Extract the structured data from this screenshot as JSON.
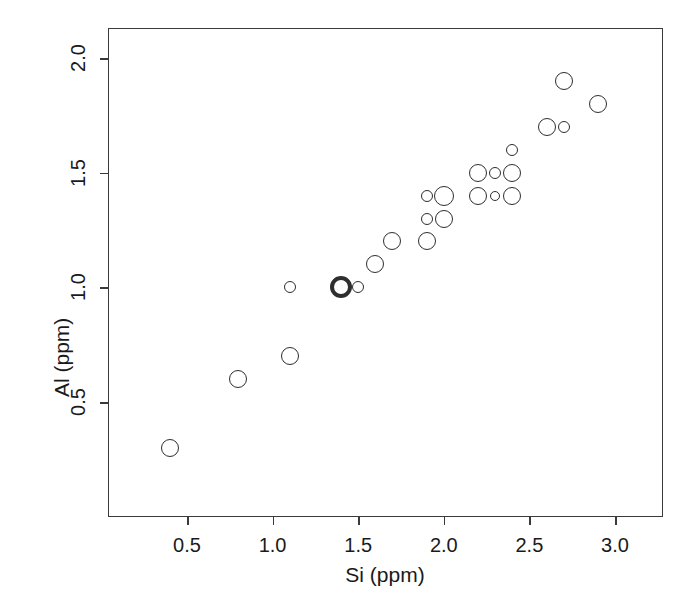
{
  "chart_data": {
    "type": "scatter",
    "title": "",
    "xlabel": "Si (ppm)",
    "ylabel": "Al (ppm)",
    "xlim": [
      0.24,
      3.22
    ],
    "ylim": [
      0.18,
      2.12
    ],
    "xticks": [
      "0.5",
      "1.0",
      "1.5",
      "2.0",
      "2.5",
      "3.0"
    ],
    "xtick_values": [
      0.5,
      1.0,
      1.5,
      2.0,
      2.5,
      3.0
    ],
    "yticks": [
      "0.5",
      "1.0",
      "1.5",
      "2.0"
    ],
    "ytick_values": [
      0.5,
      1.0,
      1.5,
      2.0
    ],
    "grid": false,
    "legend": "none",
    "marker": "open-circle",
    "marker_color": "#2e2e2e",
    "x": [
      0.4,
      0.8,
      1.1,
      1.1,
      1.4,
      1.5,
      1.6,
      1.7,
      1.9,
      1.9,
      1.9,
      2.0,
      2.0,
      2.2,
      2.2,
      2.3,
      2.3,
      2.4,
      2.4,
      2.4,
      2.6,
      2.7,
      2.7,
      2.9
    ],
    "y": [
      0.3,
      0.6,
      0.7,
      1.0,
      1.0,
      1.0,
      1.1,
      1.2,
      1.2,
      1.3,
      1.4,
      1.3,
      1.4,
      1.4,
      1.5,
      1.4,
      1.5,
      1.4,
      1.5,
      1.6,
      1.7,
      1.7,
      1.9,
      1.8
    ],
    "sizes": [
      9,
      9,
      9,
      6,
      11,
      6,
      9,
      9,
      9,
      6,
      6,
      9,
      10,
      9,
      9,
      5,
      6,
      9,
      9,
      6,
      9,
      6,
      9,
      9
    ],
    "emphasis_index": 4,
    "emphasis_note": "bold thick-stroke circle at (1.4, 1.0)",
    "points": [
      {
        "x": 0.4,
        "y": 0.3,
        "size": 9,
        "bold": false
      },
      {
        "x": 0.8,
        "y": 0.6,
        "size": 9,
        "bold": false
      },
      {
        "x": 1.1,
        "y": 0.7,
        "size": 9,
        "bold": false
      },
      {
        "x": 1.1,
        "y": 1.0,
        "size": 6,
        "bold": false
      },
      {
        "x": 1.4,
        "y": 1.0,
        "size": 11,
        "bold": true
      },
      {
        "x": 1.5,
        "y": 1.0,
        "size": 6,
        "bold": false
      },
      {
        "x": 1.6,
        "y": 1.1,
        "size": 9,
        "bold": false
      },
      {
        "x": 1.7,
        "y": 1.2,
        "size": 9,
        "bold": false
      },
      {
        "x": 1.9,
        "y": 1.2,
        "size": 9,
        "bold": false
      },
      {
        "x": 1.9,
        "y": 1.3,
        "size": 6,
        "bold": false
      },
      {
        "x": 1.9,
        "y": 1.4,
        "size": 6,
        "bold": false
      },
      {
        "x": 2.0,
        "y": 1.3,
        "size": 9,
        "bold": false
      },
      {
        "x": 2.0,
        "y": 1.4,
        "size": 10,
        "bold": false
      },
      {
        "x": 2.2,
        "y": 1.4,
        "size": 9,
        "bold": false
      },
      {
        "x": 2.2,
        "y": 1.5,
        "size": 9,
        "bold": false
      },
      {
        "x": 2.3,
        "y": 1.4,
        "size": 5,
        "bold": false
      },
      {
        "x": 2.3,
        "y": 1.5,
        "size": 6,
        "bold": false
      },
      {
        "x": 2.4,
        "y": 1.4,
        "size": 9,
        "bold": false
      },
      {
        "x": 2.4,
        "y": 1.5,
        "size": 9,
        "bold": false
      },
      {
        "x": 2.4,
        "y": 1.6,
        "size": 6,
        "bold": false
      },
      {
        "x": 2.6,
        "y": 1.7,
        "size": 9,
        "bold": false
      },
      {
        "x": 2.7,
        "y": 1.7,
        "size": 6,
        "bold": false
      },
      {
        "x": 2.7,
        "y": 1.9,
        "size": 9,
        "bold": false
      },
      {
        "x": 2.9,
        "y": 1.8,
        "size": 9,
        "bold": false
      }
    ]
  },
  "axes": {
    "x_title": "Si (ppm)",
    "y_title": "Al (ppm)"
  }
}
